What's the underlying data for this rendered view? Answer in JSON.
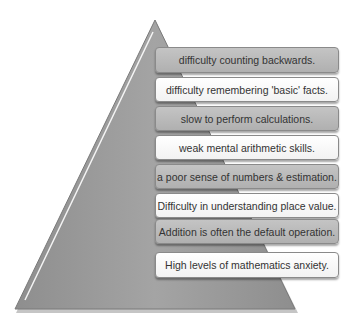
{
  "diagram": {
    "type": "pyramid",
    "colors": {
      "pyramid": "#9a9a9a",
      "dark_box": "#b8b8b8",
      "light_box": "#ffffff"
    },
    "items": [
      {
        "label": "difficulty counting backwards.",
        "style": "dark"
      },
      {
        "label": "difficulty remembering 'basic' facts.",
        "style": "light"
      },
      {
        "label": "slow to perform calculations.",
        "style": "dark"
      },
      {
        "label": "weak mental arithmetic skills.",
        "style": "light"
      },
      {
        "label": "a poor sense of numbers & estimation.",
        "style": "dark"
      },
      {
        "label": "Difficulty in understanding place value.",
        "style": "light"
      },
      {
        "label": "Addition is often the default operation.",
        "style": "dark"
      },
      {
        "label": "High levels of mathematics anxiety.",
        "style": "light"
      }
    ]
  }
}
